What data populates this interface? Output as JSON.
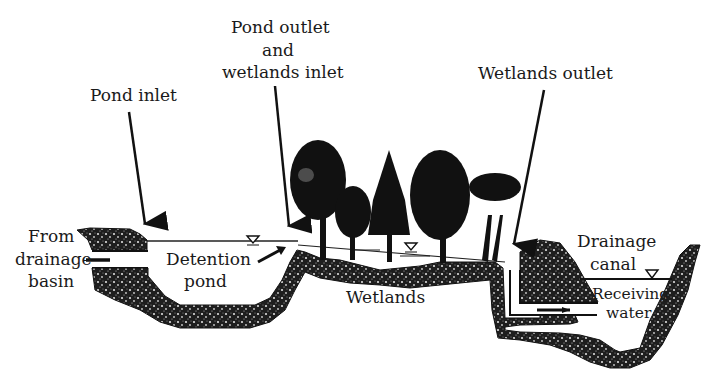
{
  "diagram": {
    "type": "cross-section schematic",
    "colors": {
      "ink": "#111111",
      "soil_fill": "#2a2a2a",
      "background": "#ffffff",
      "text": "#1a1a1a"
    },
    "labels": {
      "pond_inlet": "Pond inlet",
      "pond_outlet_line1": "Pond outlet",
      "pond_outlet_line2": "and",
      "pond_outlet_line3": "wetlands inlet",
      "wetlands_outlet": "Wetlands outlet",
      "from_line1": "From",
      "from_line2": "drainage",
      "from_line3": "basin",
      "detention_line1": "Detention",
      "detention_line2": "pond",
      "wetlands": "Wetlands",
      "drainage_line1": "Drainage",
      "drainage_line2": "canal",
      "receiving_line1": "Receiving",
      "receiving_line2": "water"
    },
    "components": [
      {
        "name": "Drainage basin inflow pipe",
        "flow": "left-to-right"
      },
      {
        "name": "Detention pond",
        "water_level_marker": true
      },
      {
        "name": "Wetlands",
        "water_level_marker": true,
        "trees": 6
      },
      {
        "name": "Wetlands outlet pipe",
        "flow": "left-to-right"
      },
      {
        "name": "Drainage canal / Receiving water",
        "water_level_marker": true
      }
    ],
    "icons": {
      "water_level": "inverted-triangle-water-level-icon",
      "flow_arrow": "flow-arrow-icon",
      "tree": "tree-icon",
      "pointer": "pointer-arrow-icon"
    }
  }
}
